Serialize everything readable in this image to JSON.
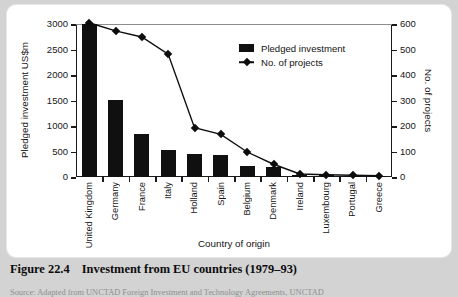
{
  "figure": {
    "caption_number": "Figure 22.4",
    "caption_title": "Investment from EU countries (1979–93)",
    "source_note": "Source: Adapted from UNCTAD Foreign Investment and Technology Agreements, UNCTAD"
  },
  "legend": {
    "position": "inside-top-right",
    "entries": [
      {
        "label": "Pledged investment",
        "marker": "filled-square",
        "color": "#101010"
      },
      {
        "label": "No. of projects",
        "marker": "line-diamond",
        "color": "#0d0d0d"
      }
    ]
  },
  "chart_data": {
    "type": "bar",
    "title": "Investment from EU countries (1979–93)",
    "xlabel": "Country of origin",
    "ylabel": "Pledged investment US$m",
    "y2label": "No. of projects",
    "grid": false,
    "ylim": [
      0,
      3000
    ],
    "y2lim": [
      0,
      600
    ],
    "yticks": [
      0,
      500,
      1000,
      1500,
      2000,
      2500,
      3000
    ],
    "y2ticks": [
      0,
      100,
      200,
      300,
      400,
      500,
      600
    ],
    "ytick_labels": [
      "0",
      "500",
      "1000",
      "1500",
      "2000",
      "2500",
      "3000"
    ],
    "y2tick_labels": [
      "0",
      "100",
      "200",
      "300",
      "400",
      "500",
      "600"
    ],
    "categories": [
      "United Kingdom",
      "Germany",
      "France",
      "Italy",
      "Holland",
      "Spain",
      "Belgium",
      "Denmark",
      "Ireland",
      "Luxembourg",
      "Portugal",
      "Greece"
    ],
    "series": [
      {
        "name": "Pledged investment",
        "type": "bar",
        "axis": "left",
        "unit": "US$m",
        "values": [
          3000,
          1510,
          850,
          520,
          460,
          440,
          215,
          195,
          40,
          30,
          25,
          10
        ]
      },
      {
        "name": "No. of projects",
        "type": "line",
        "axis": "right",
        "unit": "projects",
        "values": [
          605,
          573,
          549,
          482,
          193,
          167,
          98,
          50,
          12,
          9,
          7,
          5
        ]
      }
    ]
  }
}
